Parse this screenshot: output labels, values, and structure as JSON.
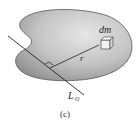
{
  "figure": {
    "caption": "(c)",
    "labels": {
      "mass_element": "dm",
      "radius": "r",
      "axis": "L",
      "axis_subscript": "O"
    },
    "colors": {
      "body_fill_light": "#e4e4e4",
      "body_fill_dark": "#9a9a9a",
      "outline": "#444444",
      "line": "#222222"
    }
  }
}
